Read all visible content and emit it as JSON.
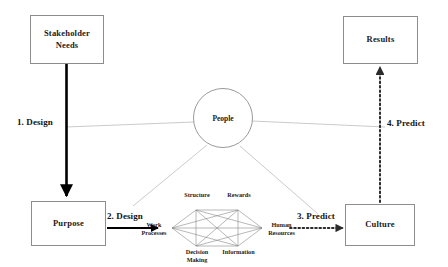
{
  "diagram": {
    "background_color": "#ffffff",
    "box_border_color": "#8d8d8d",
    "solid_arrow_color": "#000000",
    "dotted_arrow_color": "#2b2b2b",
    "thin_line_color": "#b9b9b9",
    "star_line_color": "#7a7a7a"
  },
  "nodes": {
    "stakeholder_needs": {
      "label": "Stakeholder\nNeeds",
      "line1": "Stakeholder",
      "line2": "Needs",
      "shape": "rect"
    },
    "results": {
      "label": "Results",
      "shape": "rect"
    },
    "purpose": {
      "label": "Purpose",
      "shape": "rect"
    },
    "culture": {
      "label": "Culture",
      "shape": "rect"
    },
    "people": {
      "label": "People",
      "shape": "circle"
    }
  },
  "edges": [
    {
      "id": "design-1",
      "label": "1. Design",
      "style": "solid-thick",
      "from": "stakeholder_needs",
      "to": "purpose",
      "direction": "down"
    },
    {
      "id": "design-2",
      "label": "2. Design",
      "style": "solid",
      "from": "purpose",
      "to": "star_model",
      "direction": "right"
    },
    {
      "id": "predict-3",
      "label": "3. Predict",
      "style": "dotted",
      "from": "star_model",
      "to": "culture",
      "direction": "right"
    },
    {
      "id": "predict-4",
      "label": "4. Predict",
      "style": "dotted",
      "from": "culture",
      "to": "results",
      "direction": "up"
    }
  ],
  "star_model": {
    "name": "Star Model",
    "nodes": [
      {
        "id": "structure",
        "label": "Structure",
        "position": "top-left"
      },
      {
        "id": "rewards",
        "label": "Rewards",
        "position": "top-right"
      },
      {
        "id": "work-processes",
        "label": "Work\nProcesses",
        "line1": "Work",
        "line2": "Processes",
        "position": "left"
      },
      {
        "id": "human-resources",
        "label": "Human\nResources",
        "line1": "Human",
        "line2": "Resources",
        "position": "right"
      },
      {
        "id": "decision-making",
        "label": "Decision\nMaking",
        "line1": "Decision",
        "line2": "Making",
        "position": "bottom-left"
      },
      {
        "id": "information",
        "label": "Information",
        "position": "bottom-right"
      }
    ],
    "fully_connected": true
  },
  "people_connectors": [
    {
      "to": "design-1-label",
      "style": "thin-gray"
    },
    {
      "to": "design-2-label",
      "style": "thin-gray"
    },
    {
      "to": "predict-3-label",
      "style": "thin-gray"
    },
    {
      "to": "predict-4-label",
      "style": "thin-gray"
    }
  ]
}
